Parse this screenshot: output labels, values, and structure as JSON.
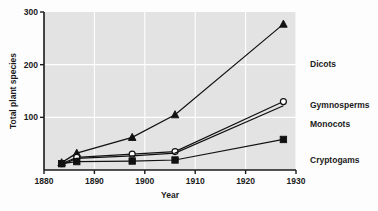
{
  "chart_data": {
    "type": "line",
    "title": "",
    "xlabel": "Year",
    "ylabel": "Total plant species",
    "xlim": [
      1880,
      1930
    ],
    "ylim": [
      0,
      300
    ],
    "xticks": [
      1880,
      1890,
      1900,
      1910,
      1920,
      1930
    ],
    "xtick_labels": [
      "1880",
      "1890",
      "1900",
      "1910",
      "1920",
      "1930"
    ],
    "yticks": [
      100,
      200,
      300
    ],
    "ytick_labels": [
      "100",
      "200",
      "300"
    ],
    "grid": "white gridlines on gray plot background",
    "legend_position": "right of plot, inline series labels",
    "series": [
      {
        "name": "Dicots",
        "marker": "filled-triangle",
        "x": [
          1883.5,
          1886.5,
          1897.5,
          1906,
          1927.5
        ],
        "values": [
          14,
          32,
          62,
          105,
          277
        ]
      },
      {
        "name": "Gymnosperms",
        "marker": "open-circle",
        "x": [
          1883.5,
          1886.5,
          1897.5,
          1906,
          1927.5
        ],
        "values": [
          12,
          24,
          30,
          35,
          130
        ]
      },
      {
        "name": "Monocots",
        "marker": "none",
        "x": [
          1883.5,
          1886.5,
          1897.5,
          1906,
          1927.5
        ],
        "values": [
          10,
          22,
          27,
          32,
          122
        ]
      },
      {
        "name": "Cryptogams",
        "marker": "filled-square",
        "x": [
          1883.5,
          1886.5,
          1897.5,
          1906,
          1927.5
        ],
        "values": [
          12,
          16,
          17,
          19,
          58
        ]
      }
    ],
    "series_labels": [
      {
        "text": "Dicots",
        "x_px": 310,
        "y_px": 67
      },
      {
        "text": "Gymnosperms",
        "x_px": 310,
        "y_px": 108
      },
      {
        "text": "Monocots",
        "x_px": 310,
        "y_px": 127
      },
      {
        "text": "Cryptogams",
        "x_px": 310,
        "y_px": 163
      }
    ],
    "colors": {
      "plot_background": "#e3e3e3",
      "gridlines": "#ffffff",
      "axis": "#1a1a1a",
      "series_line": "#111111",
      "page_background": "#fdfdfd"
    }
  }
}
